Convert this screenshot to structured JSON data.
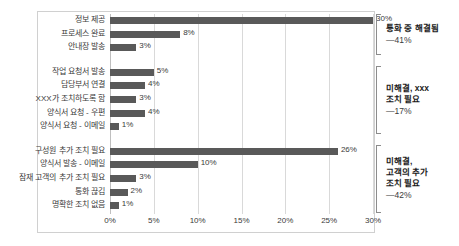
{
  "chart_data": {
    "type": "bar",
    "orientation": "horizontal",
    "title": "",
    "xlabel": "",
    "ylabel": "",
    "xlim": [
      0,
      30
    ],
    "grid": true,
    "legend": null,
    "bar_color": "#595959",
    "xticks": [
      "0%",
      "5%",
      "10%",
      "15%",
      "20%",
      "25%",
      "30%"
    ],
    "xtick_values": [
      0,
      5,
      10,
      15,
      20,
      25,
      30
    ],
    "categories": [
      "정보 제공",
      "프로세스 완료",
      "안내장 발송",
      "작업 요청서 발송",
      "담당부서 연결",
      "XXX가 조치하도록 함",
      "양식서 요청 - 우편",
      "양식서 요청 - 이메일",
      "구성원 추가 조치 필요",
      "양식서 발송 - 이메일",
      "잠재 고객의 추가 조치 필요",
      "통화 끊김",
      "명확한 조치 없음"
    ],
    "values": [
      30,
      8,
      3,
      5,
      4,
      3,
      4,
      1,
      26,
      10,
      3,
      2,
      1
    ],
    "value_labels": [
      "30%",
      "8%",
      "3%",
      "5%",
      "4%",
      "3%",
      "4%",
      "1%",
      "26%",
      "10%",
      "3%",
      "2%",
      "1%"
    ],
    "groups": [
      {
        "title": "통화 중 해결됨",
        "value": "—41%",
        "start_index": 0,
        "end_index": 2
      },
      {
        "title": "미해결, xxx\n조치 필요",
        "value": "—17%",
        "start_index": 3,
        "end_index": 7
      },
      {
        "title": "미해결,\n고객의 추가\n조치 필요",
        "value": "—42%",
        "start_index": 8,
        "end_index": 12
      }
    ]
  }
}
